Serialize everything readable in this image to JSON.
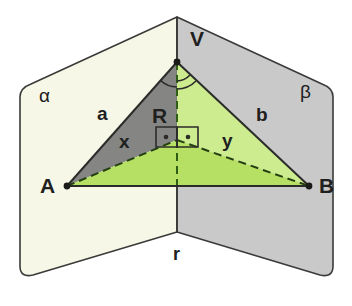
{
  "figure": {
    "background_color": "#ffffff",
    "width": 352,
    "height": 306
  },
  "colors": {
    "plane_alpha_fill": "#f7f7e8",
    "plane_beta_fill": "#c9c9c9",
    "triangle_avr_fill": "#7e7e7e",
    "triangle_vrb_fill": "#cdeb8f",
    "triangle_arb_fill": "#b5e063",
    "outline": "#3a3a38",
    "text": "#20201e"
  },
  "planes": [
    {
      "id": "alpha",
      "label": "α",
      "fill": "#f7f7e8"
    },
    {
      "id": "beta",
      "label": "β",
      "fill": "#c9c9c9"
    }
  ],
  "fold_line": {
    "label": "r",
    "description": "intersection line of the two planes"
  },
  "points": [
    {
      "id": "V",
      "label": "V",
      "x": 177,
      "y": 62,
      "plane": "fold"
    },
    {
      "id": "A",
      "label": "A",
      "x": 67,
      "y": 186,
      "plane": "alpha"
    },
    {
      "id": "B",
      "label": "B",
      "x": 309,
      "y": 186,
      "plane": "beta"
    },
    {
      "id": "R",
      "label": "R",
      "x": 177,
      "y": 140,
      "plane": "fold"
    }
  ],
  "segments": [
    {
      "id": "a",
      "label": "a",
      "from": "A",
      "to": "V",
      "style": "solid"
    },
    {
      "id": "b",
      "label": "b",
      "from": "V",
      "to": "B",
      "style": "solid"
    },
    {
      "id": "x",
      "label": "x",
      "from": "A",
      "to": "R",
      "style": "dashed"
    },
    {
      "id": "y",
      "label": "y",
      "from": "R",
      "to": "B",
      "style": "dashed"
    },
    {
      "id": "AB",
      "label": "",
      "from": "A",
      "to": "B",
      "style": "solid"
    },
    {
      "id": "VR",
      "label": "",
      "from": "V",
      "to": "R",
      "style": "dashed"
    }
  ],
  "angle_marks": [
    {
      "id": "angle-at-V-alpha",
      "at": "V",
      "arcs": 1,
      "side": "left"
    },
    {
      "id": "angle-at-V-beta",
      "at": "V",
      "arcs": 2,
      "side": "right"
    },
    {
      "id": "right-angle-left",
      "at": "R",
      "type": "right-angle-dot",
      "side": "left"
    },
    {
      "id": "right-angle-right",
      "at": "R",
      "type": "right-angle-dot",
      "side": "right"
    }
  ],
  "labels": {
    "vertex_V": "V",
    "vertex_A": "A",
    "vertex_B": "B",
    "vertex_R": "R",
    "seg_a": "a",
    "seg_b": "b",
    "seg_x": "x",
    "seg_y": "y",
    "plane_alpha": "α",
    "plane_beta": "β",
    "line_r": "r"
  }
}
